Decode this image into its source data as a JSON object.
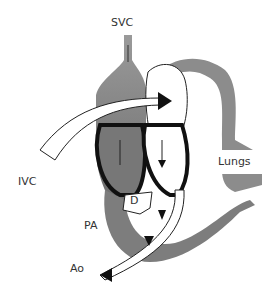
{
  "diagram": {
    "labels": {
      "svc": "SVC",
      "ivc": "IVC",
      "lungs": "Lungs",
      "d": "D",
      "pa": "PA",
      "ao": "Ao"
    },
    "colors": {
      "vessel_gray": "#8a8a8a",
      "outline": "#111111",
      "background": "#ffffff"
    }
  }
}
